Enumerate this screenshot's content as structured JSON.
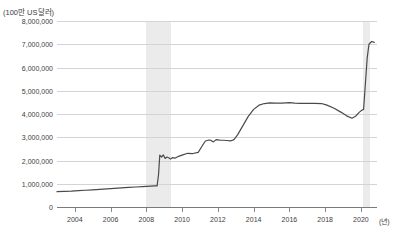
{
  "title": "",
  "axis": {
    "y_unit_label": "(100만 US달러)",
    "x_unit_label": "(년)",
    "y_ticks": [
      "8,000,000",
      "7,000,000",
      "6,000,000",
      "5,000,000",
      "4,000,000",
      "3,000,000",
      "2,000,000",
      "1,000,000",
      "0"
    ],
    "x_ticks": [
      "2004",
      "2006",
      "2008",
      "2010",
      "2012",
      "2014",
      "2016",
      "2018",
      "2020"
    ]
  },
  "colors": {
    "line": "#4a4a4a",
    "grid": "#d4d4d4",
    "axis": "#7a7a7a",
    "band": "#ebebeb",
    "text": "#3d3d3d",
    "background": "#ffffff"
  },
  "chart_data": {
    "type": "line",
    "title": "",
    "xlabel": "(년)",
    "ylabel": "(100만 US달러)",
    "xlim": [
      2003.0,
      2020.9
    ],
    "ylim": [
      0,
      8000000
    ],
    "ytick_values": [
      0,
      1000000,
      2000000,
      3000000,
      4000000,
      5000000,
      6000000,
      7000000,
      8000000
    ],
    "xtick_values": [
      2004,
      2006,
      2008,
      2010,
      2012,
      2014,
      2016,
      2018,
      2020
    ],
    "grid": true,
    "legend": null,
    "shaded_bands": [
      {
        "label": "recession-2008",
        "x_start": 2008.0,
        "x_end": 2009.4
      },
      {
        "label": "recession-2020",
        "x_start": 2020.1,
        "x_end": 2020.5
      }
    ],
    "series": [
      {
        "name": "총자산",
        "x": [
          2003.0,
          2003.4,
          2003.8,
          2004.2,
          2004.6,
          2005.0,
          2005.4,
          2005.8,
          2006.2,
          2006.6,
          2007.0,
          2007.4,
          2007.8,
          2008.0,
          2008.25,
          2008.45,
          2008.6,
          2008.68,
          2008.75,
          2008.85,
          2008.95,
          2009.05,
          2009.15,
          2009.25,
          2009.35,
          2009.45,
          2009.6,
          2009.8,
          2010.0,
          2010.3,
          2010.6,
          2010.9,
          2011.1,
          2011.3,
          2011.5,
          2011.6,
          2011.75,
          2011.9,
          2012.1,
          2012.3,
          2012.5,
          2012.7,
          2012.9,
          2013.1,
          2013.4,
          2013.7,
          2014.0,
          2014.3,
          2014.6,
          2014.9,
          2015.2,
          2015.6,
          2016.0,
          2016.3,
          2016.6,
          2017.0,
          2017.4,
          2017.8,
          2018.1,
          2018.5,
          2018.9,
          2019.2,
          2019.5,
          2019.7,
          2019.9,
          2020.05,
          2020.15,
          2020.25,
          2020.35,
          2020.45,
          2020.6,
          2020.75
        ],
        "y": [
          660000,
          670000,
          680000,
          700000,
          720000,
          740000,
          760000,
          780000,
          800000,
          820000,
          840000,
          860000,
          880000,
          890000,
          900000,
          905000,
          910000,
          1400000,
          2230000,
          2150000,
          2240000,
          2090000,
          2150000,
          2120000,
          2060000,
          2120000,
          2100000,
          2180000,
          2230000,
          2310000,
          2300000,
          2350000,
          2600000,
          2840000,
          2880000,
          2870000,
          2800000,
          2900000,
          2880000,
          2870000,
          2860000,
          2840000,
          2900000,
          3100000,
          3500000,
          3900000,
          4200000,
          4380000,
          4450000,
          4480000,
          4470000,
          4470000,
          4490000,
          4470000,
          4460000,
          4460000,
          4460000,
          4450000,
          4380000,
          4250000,
          4070000,
          3920000,
          3820000,
          3900000,
          4070000,
          4160000,
          4200000,
          5300000,
          6400000,
          7000000,
          7120000,
          7080000
        ]
      }
    ]
  }
}
